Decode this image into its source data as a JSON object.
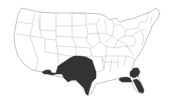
{
  "map": {
    "type": "choropleth",
    "region": "Contiguous United States",
    "colors": {
      "background": "#ffffff",
      "border": "#a8a8a8",
      "highlight": "#333333"
    },
    "highlighted_regions": [
      {
        "name": "Texas / Oklahoma / southern New Mexico & Arizona region",
        "color": "#333333"
      },
      {
        "name": "Southern Georgia / South Carolina area",
        "color": "#333333"
      },
      {
        "name": "Florida panhandle / southern Alabama area",
        "color": "#333333"
      },
      {
        "name": "Peninsular Florida",
        "color": "#333333"
      }
    ]
  }
}
